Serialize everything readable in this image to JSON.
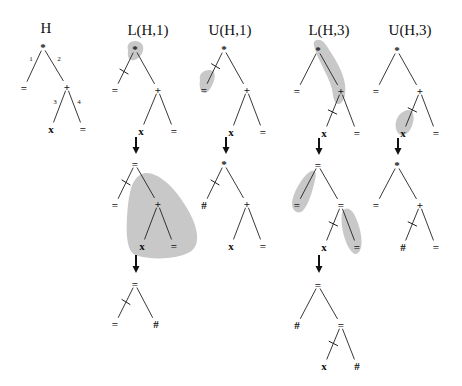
{
  "diagram": {
    "colors": {
      "highlight": "#b5b5b5",
      "ink": "#111111",
      "background": "#ffffff"
    },
    "titles": [
      {
        "id": "H",
        "text": "H",
        "x": 46,
        "y": 33
      },
      {
        "id": "L1",
        "text": "L(H,1)",
        "x": 148,
        "y": 35
      },
      {
        "id": "U1",
        "text": "U(H,1)",
        "x": 230,
        "y": 35
      },
      {
        "id": "L3",
        "text": "L(H,3)",
        "x": 329,
        "y": 35
      },
      {
        "id": "U3",
        "text": "U(H,3)",
        "x": 410,
        "y": 35
      }
    ],
    "trees": [
      {
        "id": "H-tree",
        "nodes": [
          {
            "id": "r",
            "label": "*",
            "x": 43,
            "y": 47
          },
          {
            "id": "a",
            "label": "=",
            "x": 24,
            "y": 88
          },
          {
            "id": "b",
            "label": "+",
            "x": 67,
            "y": 87
          },
          {
            "id": "c",
            "label": "x",
            "x": 51,
            "y": 129
          },
          {
            "id": "d",
            "label": "=",
            "x": 83,
            "y": 129
          }
        ],
        "edges": [
          {
            "from": "r",
            "to": "a",
            "label": "1",
            "lx": 31,
            "ly": 61
          },
          {
            "from": "r",
            "to": "b",
            "label": "2",
            "lx": 59,
            "ly": 61
          },
          {
            "from": "b",
            "to": "c",
            "label": "3",
            "lx": 55,
            "ly": 104
          },
          {
            "from": "b",
            "to": "d",
            "label": "4",
            "lx": 79,
            "ly": 104
          }
        ],
        "cuts": [],
        "blobs": []
      },
      {
        "id": "L1-top",
        "nodes": [
          {
            "id": "r",
            "label": "*",
            "x": 135,
            "y": 49
          },
          {
            "id": "a",
            "label": "=",
            "x": 115,
            "y": 90
          },
          {
            "id": "b",
            "label": "+",
            "x": 158,
            "y": 90
          },
          {
            "id": "c",
            "label": "x",
            "x": 141,
            "y": 131
          },
          {
            "id": "d",
            "label": "=",
            "x": 174,
            "y": 131
          }
        ],
        "edges": [
          {
            "from": "r",
            "to": "a"
          },
          {
            "from": "r",
            "to": "b"
          },
          {
            "from": "b",
            "to": "c"
          },
          {
            "from": "b",
            "to": "d"
          }
        ],
        "cuts": [
          {
            "from": "r",
            "to": "a",
            "t": 0.55
          }
        ],
        "blobs": [
          "M128,50 C125,40 140,38 143,46 C145,54 136,62 131,60 C127,58 128,54 128,50 Z"
        ]
      },
      {
        "id": "U1-top",
        "nodes": [
          {
            "id": "r",
            "label": "*",
            "x": 224,
            "y": 49
          },
          {
            "id": "a",
            "label": "=",
            "x": 204,
            "y": 90
          },
          {
            "id": "b",
            "label": "+",
            "x": 247,
            "y": 90
          },
          {
            "id": "c",
            "label": "x",
            "x": 231,
            "y": 132
          },
          {
            "id": "d",
            "label": "=",
            "x": 263,
            "y": 132
          }
        ],
        "edges": [
          {
            "from": "r",
            "to": "a"
          },
          {
            "from": "r",
            "to": "b"
          },
          {
            "from": "b",
            "to": "c"
          },
          {
            "from": "b",
            "to": "d"
          }
        ],
        "cuts": [
          {
            "from": "r",
            "to": "a",
            "t": 0.42
          }
        ],
        "blobs": [
          "M200,80 C198,72 208,68 213,71 C218,75 211,92 205,93 C200,93 199,86 200,80 Z"
        ]
      },
      {
        "id": "L3-top",
        "nodes": [
          {
            "id": "r",
            "label": "*",
            "x": 318,
            "y": 50
          },
          {
            "id": "a",
            "label": "=",
            "x": 297,
            "y": 91
          },
          {
            "id": "b",
            "label": "+",
            "x": 341,
            "y": 91
          },
          {
            "id": "c",
            "label": "x",
            "x": 324,
            "y": 133
          },
          {
            "id": "d",
            "label": "=",
            "x": 357,
            "y": 133
          }
        ],
        "edges": [
          {
            "from": "r",
            "to": "a"
          },
          {
            "from": "r",
            "to": "b"
          },
          {
            "from": "b",
            "to": "c"
          },
          {
            "from": "b",
            "to": "d"
          }
        ],
        "cuts": [
          {
            "from": "b",
            "to": "c",
            "t": 0.5
          }
        ],
        "blobs": [
          "M314,46 C312,38 322,38 326,45 C336,60 348,78 345,95 C342,108 334,106 333,95 C332,80 318,62 314,46 Z"
        ]
      },
      {
        "id": "U3-top",
        "nodes": [
          {
            "id": "r",
            "label": "*",
            "x": 397,
            "y": 50
          },
          {
            "id": "a",
            "label": "=",
            "x": 376,
            "y": 91
          },
          {
            "id": "b",
            "label": "+",
            "x": 420,
            "y": 91
          },
          {
            "id": "c",
            "label": "x",
            "x": 403,
            "y": 133
          },
          {
            "id": "d",
            "label": "=",
            "x": 436,
            "y": 133
          }
        ],
        "edges": [
          {
            "from": "r",
            "to": "a"
          },
          {
            "from": "r",
            "to": "b"
          },
          {
            "from": "b",
            "to": "c"
          },
          {
            "from": "b",
            "to": "d"
          }
        ],
        "cuts": [
          {
            "from": "b",
            "to": "c",
            "t": 0.45
          }
        ],
        "blobs": [
          "M396,128 C394,118 402,110 409,110 C416,111 414,124 410,130 C406,137 397,137 396,128 Z"
        ]
      },
      {
        "id": "L1-mid",
        "nodes": [
          {
            "id": "r",
            "label": "=",
            "x": 135,
            "y": 164
          },
          {
            "id": "a",
            "label": "=",
            "x": 115,
            "y": 205
          },
          {
            "id": "b",
            "label": "+",
            "x": 158,
            "y": 204
          },
          {
            "id": "c",
            "label": "x",
            "x": 142,
            "y": 246
          },
          {
            "id": "d",
            "label": "=",
            "x": 174,
            "y": 246
          }
        ],
        "edges": [
          {
            "from": "r",
            "to": "a"
          },
          {
            "from": "r",
            "to": "b"
          },
          {
            "from": "b",
            "to": "c"
          },
          {
            "from": "b",
            "to": "d"
          }
        ],
        "cuts": [
          {
            "from": "r",
            "to": "a",
            "t": 0.45
          }
        ],
        "blobs": [
          "M140,175 C150,168 170,180 185,205 C198,225 202,245 190,252 C175,260 150,260 135,255 C125,250 126,225 128,205 C130,190 132,180 140,175 Z"
        ]
      },
      {
        "id": "U1-mid",
        "nodes": [
          {
            "id": "r",
            "label": "*",
            "x": 224,
            "y": 164
          },
          {
            "id": "a",
            "label": "#",
            "x": 204,
            "y": 205
          },
          {
            "id": "b",
            "label": "+",
            "x": 247,
            "y": 204
          },
          {
            "id": "c",
            "label": "x",
            "x": 231,
            "y": 246
          },
          {
            "id": "d",
            "label": "=",
            "x": 263,
            "y": 246
          }
        ],
        "edges": [
          {
            "from": "r",
            "to": "a"
          },
          {
            "from": "r",
            "to": "b"
          },
          {
            "from": "b",
            "to": "c"
          },
          {
            "from": "b",
            "to": "d"
          }
        ],
        "cuts": [
          {
            "from": "r",
            "to": "a",
            "t": 0.45
          }
        ],
        "blobs": []
      },
      {
        "id": "L3-mid",
        "nodes": [
          {
            "id": "r",
            "label": "=",
            "x": 318,
            "y": 165
          },
          {
            "id": "a",
            "label": "=",
            "x": 297,
            "y": 205
          },
          {
            "id": "b",
            "label": "=",
            "x": 341,
            "y": 205
          },
          {
            "id": "c",
            "label": "x",
            "x": 324,
            "y": 247
          },
          {
            "id": "d",
            "label": "=",
            "x": 357,
            "y": 247
          }
        ],
        "edges": [
          {
            "from": "r",
            "to": "a"
          },
          {
            "from": "r",
            "to": "b"
          },
          {
            "from": "b",
            "to": "c"
          },
          {
            "from": "b",
            "to": "d"
          }
        ],
        "cuts": [
          {
            "from": "b",
            "to": "c",
            "t": 0.45
          }
        ],
        "blobs": [
          "M295,211 C288,205 295,188 305,176 C312,168 318,169 315,180 C312,195 306,210 301,212 C298,213 296,212 295,211 Z",
          "M352,252 C345,245 340,225 342,213 C345,205 352,208 356,218 C362,232 364,248 358,253 C356,255 354,254 352,252 Z"
        ]
      },
      {
        "id": "U3-mid",
        "nodes": [
          {
            "id": "r",
            "label": "*",
            "x": 397,
            "y": 165
          },
          {
            "id": "a",
            "label": "=",
            "x": 376,
            "y": 205
          },
          {
            "id": "b",
            "label": "+",
            "x": 420,
            "y": 205
          },
          {
            "id": "c",
            "label": "#",
            "x": 403,
            "y": 247
          },
          {
            "id": "d",
            "label": "=",
            "x": 436,
            "y": 247
          }
        ],
        "edges": [
          {
            "from": "r",
            "to": "a"
          },
          {
            "from": "r",
            "to": "b"
          },
          {
            "from": "b",
            "to": "c"
          },
          {
            "from": "b",
            "to": "d"
          }
        ],
        "cuts": [
          {
            "from": "b",
            "to": "c",
            "t": 0.45
          }
        ],
        "blobs": []
      },
      {
        "id": "L1-bottom",
        "nodes": [
          {
            "id": "r",
            "label": "=",
            "x": 135,
            "y": 284
          },
          {
            "id": "a",
            "label": "=",
            "x": 115,
            "y": 324
          },
          {
            "id": "b",
            "label": "#",
            "x": 156,
            "y": 324
          }
        ],
        "edges": [
          {
            "from": "r",
            "to": "a"
          },
          {
            "from": "r",
            "to": "b"
          }
        ],
        "cuts": [
          {
            "from": "r",
            "to": "a",
            "t": 0.45
          }
        ],
        "blobs": []
      },
      {
        "id": "L3-bottom",
        "nodes": [
          {
            "id": "r",
            "label": "=",
            "x": 318,
            "y": 285
          },
          {
            "id": "a",
            "label": "#",
            "x": 297,
            "y": 325
          },
          {
            "id": "b",
            "label": "=",
            "x": 341,
            "y": 325
          },
          {
            "id": "c",
            "label": "x",
            "x": 324,
            "y": 366
          },
          {
            "id": "d",
            "label": "#",
            "x": 357,
            "y": 366
          }
        ],
        "edges": [
          {
            "from": "r",
            "to": "a"
          },
          {
            "from": "r",
            "to": "b"
          },
          {
            "from": "b",
            "to": "c"
          },
          {
            "from": "b",
            "to": "d"
          }
        ],
        "cuts": [
          {
            "from": "b",
            "to": "c",
            "t": 0.45
          }
        ],
        "blobs": []
      }
    ],
    "arrows": [
      {
        "x": 136,
        "y1": 137,
        "y2": 154
      },
      {
        "x": 226,
        "y1": 137,
        "y2": 154
      },
      {
        "x": 319,
        "y1": 138,
        "y2": 155
      },
      {
        "x": 398,
        "y1": 138,
        "y2": 155
      },
      {
        "x": 136,
        "y1": 255,
        "y2": 273
      },
      {
        "x": 319,
        "y1": 255,
        "y2": 273
      }
    ]
  }
}
